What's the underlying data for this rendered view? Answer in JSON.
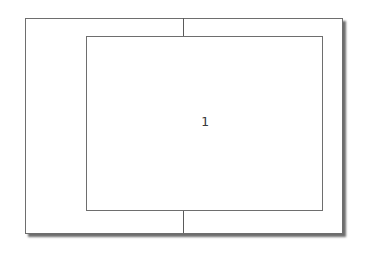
{
  "diagram": {
    "label": "1",
    "colors": {
      "border": "#6e6e6e",
      "divider": "#5a5a5a",
      "text": "#3a3a3a",
      "background": "#ffffff"
    },
    "elements": [
      {
        "name": "outer-frame",
        "x": 25,
        "y": 18,
        "w": 316,
        "h": 214,
        "shadow": true
      },
      {
        "name": "inner-frame",
        "x": 86,
        "y": 36,
        "w": 237,
        "h": 175
      },
      {
        "name": "top-divider",
        "x": 183,
        "y1": 18,
        "y2": 36
      },
      {
        "name": "bottom-divider",
        "x": 183,
        "y1": 211,
        "y2": 233
      }
    ]
  }
}
